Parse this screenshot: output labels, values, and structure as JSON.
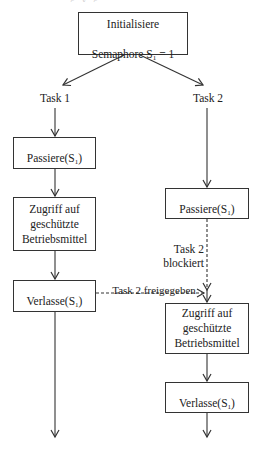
{
  "diagram": {
    "init_box": {
      "line1": "Initialisiere",
      "line2_prefix": "Semaphore S",
      "line2_sub": "1",
      "line2_suffix": " = 1"
    },
    "task1": {
      "label": "Task 1",
      "pass_box": {
        "prefix": "Passiere(S",
        "sub": "1",
        "suffix": ")"
      },
      "access_box": {
        "text": "Zugriff auf\ngeschützte\nBetriebsmittel"
      },
      "leave_box": {
        "prefix": "Verlasse(S",
        "sub": "1",
        "suffix": ")"
      }
    },
    "task2": {
      "label": "Task 2",
      "pass_box": {
        "prefix": "Passiere(S",
        "sub": "1",
        "suffix": ")"
      },
      "blocked_label": "Task 2\nblockiert",
      "access_box": {
        "text": "Zugriff auf\ngeschützte\nBetriebsmittel"
      },
      "leave_box": {
        "prefix": "Verlasse(S",
        "sub": "1",
        "suffix": ")"
      }
    },
    "release_label": "Task 2 freigegeben",
    "colors": {
      "stroke": "#333333",
      "text": "#222222",
      "background": "#ffffff"
    }
  }
}
